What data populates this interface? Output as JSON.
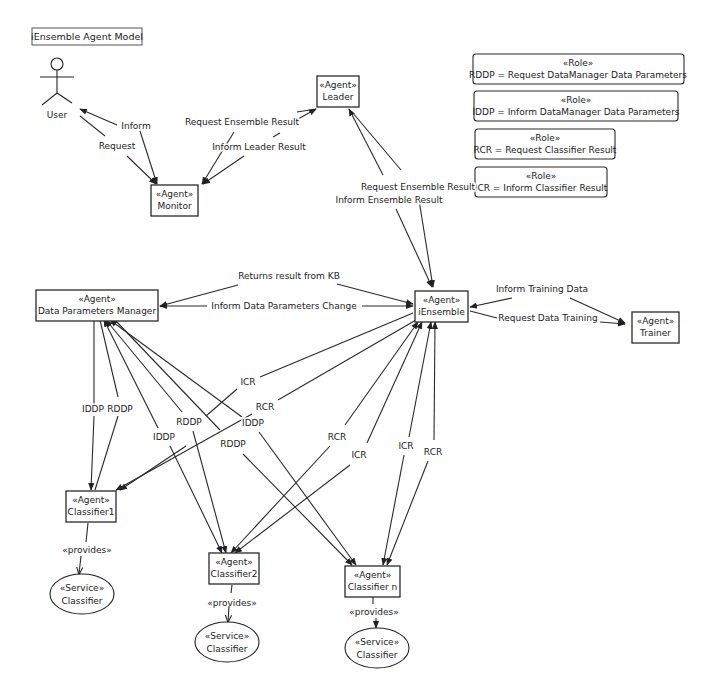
{
  "title": "iEnsemble Agent Model",
  "actor": {
    "label": "User"
  },
  "agents": {
    "leader": {
      "stereotype": "«Agent»",
      "name": "Leader"
    },
    "monitor": {
      "stereotype": "«Agent»",
      "name": "Monitor"
    },
    "dpm": {
      "stereotype": "«Agent»",
      "name": "Data Parameters Manager"
    },
    "iensemble": {
      "stereotype": "«Agent»",
      "name": "iEnsemble"
    },
    "trainer": {
      "stereotype": "«Agent»",
      "name": "Trainer"
    },
    "classifier1": {
      "stereotype": "«Agent»",
      "name": "Classifier1"
    },
    "classifier2": {
      "stereotype": "«Agent»",
      "name": "Classifier2"
    },
    "classifiern": {
      "stereotype": "«Agent»",
      "name": "Classifier n"
    }
  },
  "services": [
    {
      "stereotype": "«Service»",
      "name": "Classifier"
    },
    {
      "stereotype": "«Service»",
      "name": "Classifier"
    },
    {
      "stereotype": "«Service»",
      "name": "Classifier"
    }
  ],
  "provides_label": "«provides»",
  "roles": [
    {
      "stereotype": "«Role»",
      "text": "RDDP = Request DataManager Data Parameters"
    },
    {
      "stereotype": "«Role»",
      "text": "IDDP = Inform DataManager Data Parameters"
    },
    {
      "stereotype": "«Role»",
      "text": "RCR = Request Classifier Result"
    },
    {
      "stereotype": "«Role»",
      "text": "ICR = Inform Classifier Result"
    }
  ],
  "messages": {
    "inform": "Inform",
    "request": "Request",
    "request_ensemble_result_top": "Request Ensemble Result",
    "inform_leader_result": "Inform Leader Result",
    "request_ensemble_result": "Request Ensemble Result",
    "inform_ensemble_result": "Inform Ensemble Result",
    "returns_result_from_kb": "Returns result from KB",
    "inform_data_parameters_change": "Inform Data Parameters Change",
    "inform_training_data": "Inform Training Data",
    "request_data_training": "Request Data Training",
    "c1_iddp": "IDDP",
    "c1_rddp": "RDDP",
    "c2_iddp": "IDDP",
    "c2_rddp": "RDDP",
    "cn_iddp": "IDDP",
    "cn_rddp": "RDDP",
    "c1_icr": "ICR",
    "c1_rcr": "RCR",
    "c2_rcr": "RCR",
    "c2_icr": "ICR",
    "cn_icr": "ICR",
    "cn_rcr": "RCR"
  }
}
